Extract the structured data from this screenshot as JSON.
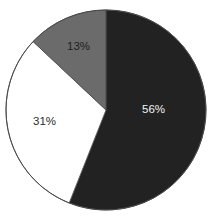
{
  "chart_data": {
    "type": "pie",
    "title": "",
    "title_note": "title is cropped off the top edge of the image and is not legible",
    "categories": [
      "56%",
      "31%",
      "13%"
    ],
    "values": [
      56,
      31,
      13
    ],
    "labels": [
      "56%",
      "31%",
      "13%"
    ],
    "colors": [
      "#222222",
      "#ffffff",
      "#6b6b6b"
    ],
    "label_colors": [
      "#f2f2f2",
      "#2b2b2b",
      "#1f1f1f"
    ],
    "start_angle_deg": 0,
    "direction": "clockwise",
    "legend": "none",
    "grid": false,
    "xlabel": "",
    "ylabel": ""
  },
  "figure": {
    "background": "#ffffff",
    "outline_color": "#4a4a4a",
    "center_x": 106,
    "center_y": 110,
    "radius": 100
  },
  "slices": [
    {
      "label": "56%",
      "value": 56,
      "color": "#222222",
      "label_color": "#f2f2f2"
    },
    {
      "label": "31%",
      "value": 31,
      "color": "#ffffff",
      "label_color": "#2b2b2b"
    },
    {
      "label": "13%",
      "value": 13,
      "color": "#6b6b6b",
      "label_color": "#1f1f1f"
    }
  ]
}
